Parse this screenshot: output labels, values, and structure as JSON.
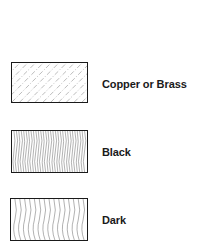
{
  "legend": {
    "items": [
      {
        "label": "Copper or Brass",
        "pattern": "diagonal-dashed-hatch"
      },
      {
        "label": "Black",
        "pattern": "dense-wavy-vertical-lines"
      },
      {
        "label": "Dark",
        "pattern": "sparse-wavy-vertical-lines"
      }
    ]
  },
  "colors": {
    "line": "#1a1a1a",
    "hatch": "#777777",
    "background": "#ffffff"
  }
}
